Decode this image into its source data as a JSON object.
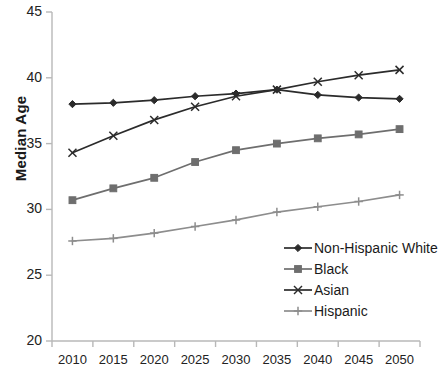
{
  "chart_data": {
    "type": "line",
    "title": "",
    "xlabel": "",
    "ylabel": "Median Age",
    "categories": [
      "2010",
      "2015",
      "2020",
      "2025",
      "2030",
      "2035",
      "2040",
      "2045",
      "2050"
    ],
    "ylim": [
      20,
      45
    ],
    "yticks": [
      20,
      25,
      30,
      35,
      40,
      45
    ],
    "grid": false,
    "legend_position": "bottom-right",
    "series": [
      {
        "name": "Non-Hispanic White",
        "marker": "diamond",
        "color": "#2b2b2b",
        "values": [
          38.0,
          38.1,
          38.3,
          38.6,
          38.8,
          39.1,
          38.7,
          38.5,
          38.4
        ]
      },
      {
        "name": "Black",
        "marker": "square",
        "color": "#6e6e6e",
        "values": [
          30.7,
          31.6,
          32.4,
          33.6,
          34.5,
          35.0,
          35.4,
          35.7,
          36.1
        ]
      },
      {
        "name": "Asian",
        "marker": "x",
        "color": "#2b2b2b",
        "values": [
          34.3,
          35.6,
          36.8,
          37.8,
          38.6,
          39.1,
          39.7,
          40.2,
          40.6
        ]
      },
      {
        "name": "Hispanic",
        "marker": "plus",
        "color": "#8d8d8d",
        "values": [
          27.6,
          27.8,
          28.2,
          28.7,
          29.2,
          29.8,
          30.2,
          30.6,
          31.1
        ]
      }
    ]
  },
  "axis": {
    "y_label": "Median Age",
    "y_ticks": [
      "45",
      "40",
      "35",
      "30",
      "25",
      "20"
    ],
    "x_ticks": [
      "2010",
      "2015",
      "2020",
      "2025",
      "2030",
      "2035",
      "2040",
      "2045",
      "2050"
    ]
  },
  "legend": {
    "items": [
      {
        "label": "Non-Hispanic White"
      },
      {
        "label": "Black"
      },
      {
        "label": "Asian"
      },
      {
        "label": "Hispanic"
      }
    ]
  },
  "caption": {
    "text": ""
  },
  "colors": {
    "axis": "#b8b8b8",
    "white_series": "#2b2b2b",
    "black_series": "#6e6e6e",
    "asian_series": "#2b2b2b",
    "hispanic_series": "#8d8d8d",
    "background": "#ffffff"
  }
}
